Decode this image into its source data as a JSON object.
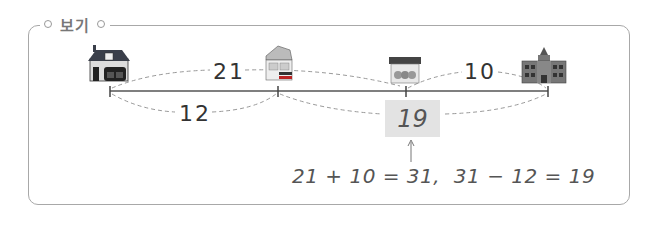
{
  "example_box": {
    "label": "보기"
  },
  "number_line": {
    "places": [
      {
        "name": "house",
        "icon": "house-icon"
      },
      {
        "name": "shop",
        "icon": "shop-icon"
      },
      {
        "name": "store",
        "icon": "store-icon"
      },
      {
        "name": "school",
        "icon": "school-icon"
      }
    ],
    "distances": {
      "house_to_shop": "21",
      "store_to_school": "10",
      "house_to_shop_lower": "12"
    },
    "answer": "19"
  },
  "solution": {
    "equation": "21 + 10 = 31,  31 − 12 = 19"
  },
  "colors": {
    "border": "#a8a8a8",
    "answer_bg": "#e3e3e3",
    "line": "#555555",
    "dash": "#999999"
  }
}
